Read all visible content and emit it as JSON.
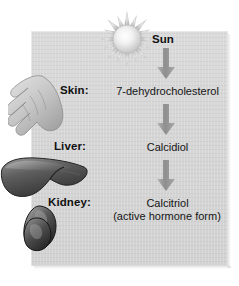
{
  "diagram": {
    "panel_color": "#d6d6d6",
    "arrow_color": "#9a9a9a",
    "text_color": "#111111",
    "sun": {
      "icon": "sun-icon",
      "label": "Sun"
    },
    "steps": [
      {
        "organ_label": "Skin:",
        "organ_icon": "hand-icon",
        "compound": "7-dehydrocholesterol",
        "subtext": ""
      },
      {
        "organ_label": "Liver:",
        "organ_icon": "liver-icon",
        "compound": "Calcidiol",
        "subtext": ""
      },
      {
        "organ_label": "Kidney:",
        "organ_icon": "kidney-icon",
        "compound": "Calcitriol",
        "subtext": "(active hormone form)"
      }
    ],
    "arrows": [
      {
        "name": "arrow-sun-to-skin"
      },
      {
        "name": "arrow-skin-to-liver"
      },
      {
        "name": "arrow-liver-to-kidney"
      }
    ]
  }
}
